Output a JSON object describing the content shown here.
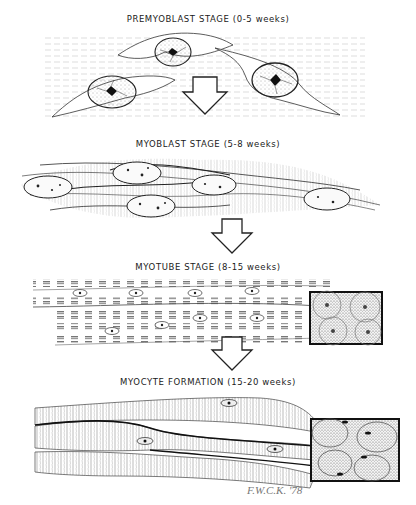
{
  "stages": [
    {
      "id": "premyoblast",
      "label": "PREMYOBLAST STAGE (0-5 weeks)"
    },
    {
      "id": "myoblast",
      "label": "MYOBLAST STAGE (5-8 weeks)"
    },
    {
      "id": "myotube",
      "label": "MYOTUBE STAGE (8-15 weeks)"
    },
    {
      "id": "myocyte",
      "label": "MYOCYTE FORMATION (15-20 weeks)"
    }
  ],
  "signature": "F.W.C.K. '78",
  "arrows": [
    "down-arrow",
    "down-arrow",
    "down-arrow"
  ],
  "insets": [
    {
      "stage": "myotube",
      "description": "cross-section-inset-nuclei-central"
    },
    {
      "stage": "myocyte",
      "description": "cross-section-inset-nuclei-peripheral"
    }
  ]
}
